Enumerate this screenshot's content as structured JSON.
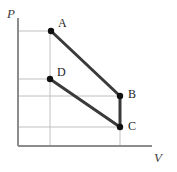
{
  "figure": {
    "width": 177,
    "height": 172,
    "background": "#ffffff"
  },
  "axes": {
    "x_label": "V",
    "y_label": "P",
    "x_axis_color": "#8c8c8c",
    "y_axis_color": "#8c8c8c",
    "grid_color": "#c0c0c0",
    "grid_on": true,
    "x_axis_y": 146,
    "y_axis_x": 18,
    "x_axis_end": 152,
    "y_axis_top": 18
  },
  "style": {
    "process_line_color": "#3a3a3a",
    "process_line_width": 3,
    "point_color": "#101010",
    "point_radius": 3.2
  },
  "chart_data": {
    "type": "line",
    "title": "",
    "xlabel": "V",
    "ylabel": "P",
    "xlim": [
      18,
      152
    ],
    "ylim": [
      146,
      18
    ],
    "grid": true,
    "legend": "none",
    "points": [
      {
        "name": "A",
        "x": 51,
        "y": 31,
        "label": "A",
        "label_x": 58,
        "label_y": 17
      },
      {
        "name": "B",
        "x": 120,
        "y": 96,
        "label": "B",
        "label_x": 128,
        "label_y": 88
      },
      {
        "name": "C",
        "x": 120,
        "y": 127,
        "label": "C",
        "label_x": 128,
        "label_y": 120
      },
      {
        "name": "D",
        "x": 50,
        "y": 79,
        "label": "D",
        "label_x": 57,
        "label_y": 66
      }
    ],
    "series": [
      {
        "name": "A-B",
        "from": "A",
        "to": "B",
        "x": [
          51,
          120
        ],
        "y": [
          31,
          96
        ]
      },
      {
        "name": "B-C",
        "from": "B",
        "to": "C",
        "x": [
          120,
          120
        ],
        "y": [
          96,
          127
        ]
      },
      {
        "name": "D-C",
        "from": "D",
        "to": "C",
        "x": [
          50,
          120
        ],
        "y": [
          79,
          127
        ]
      }
    ],
    "gridlines": {
      "horizontal": [
        {
          "value_for": "A",
          "y": 31,
          "x_start": 18,
          "x_end": 51
        },
        {
          "value_for": "D",
          "y": 79,
          "x_start": 18,
          "x_end": 50
        },
        {
          "value_for": "B",
          "y": 96,
          "x_start": 18,
          "x_end": 120
        },
        {
          "value_for": "C",
          "y": 127,
          "x_start": 18,
          "x_end": 120
        }
      ],
      "vertical": [
        {
          "value_for": "A-D",
          "x": 50,
          "y_start": 31,
          "y_end": 146
        },
        {
          "value_for": "B-C",
          "x": 120,
          "y_start": 96,
          "y_end": 146
        }
      ]
    }
  }
}
